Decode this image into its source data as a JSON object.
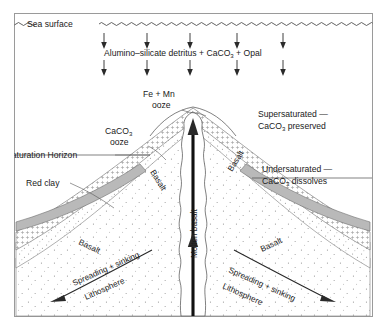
{
  "figure": {
    "sea_surface_label": "Sea surface",
    "flux_label": "Alumino–silicate detritus + CaCO",
    "flux_label_sub": "3",
    "flux_label_tail": " + Opal",
    "saturation_horizon_label": "Saturation Horizon",
    "fe_mn_line1": "Fe + Mn",
    "fe_mn_line2": "ooze",
    "caco3_ooze_line1": "CaCO",
    "caco3_ooze_sub": "3",
    "caco3_ooze_line2": "ooze",
    "red_clay_label": "Red clay",
    "supersaturated_line1": "Supersaturated —",
    "supersaturated_line2": "CaCO",
    "supersaturated_sub": "3",
    "supersaturated_line2_tail": " preserved",
    "undersaturated_line1": "Undersaturated —",
    "undersaturated_line2": "CaCO",
    "undersaturated_sub": "3",
    "undersaturated_line2_tail": " dissolves",
    "molten_basalt_label": "Molten basalt",
    "basalt_label": "Basalt",
    "spreading_line1": "Spreading + sinking",
    "spreading_line2": "Lithosphere",
    "settling_arrow_count_row1": 5,
    "settling_arrow_count_row2": 5,
    "colors": {
      "frame": "#9a9a9a",
      "ink": "#1a1a1a",
      "red_clay_band": "#b9b9b9",
      "background": "#ffffff",
      "line": "#4a4a4a"
    }
  }
}
